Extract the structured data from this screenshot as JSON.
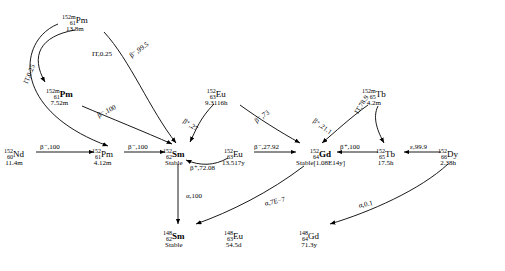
{
  "diagram": {
    "type": "nuclear-decay-chain",
    "title": "",
    "nodes": [
      {
        "id": "pm152m2",
        "mass": "152m",
        "z": "61",
        "sym": "Pm",
        "bold": false,
        "line2": "13.8m",
        "x": 76,
        "y": 14
      },
      {
        "id": "pm152m",
        "mass": "152m",
        "z": "61",
        "sym": "Pm",
        "bold": true,
        "line2": "7.52m",
        "x": 60,
        "y": 88
      },
      {
        "id": "eu152",
        "mass": "152",
        "z": "63",
        "sym": "Eu",
        "bold": false,
        "line2": "9.3116h",
        "x": 215,
        "y": 88
      },
      {
        "id": "tb152m",
        "mass": "152m",
        "z": "65",
        "sym": "Tb",
        "bold": false,
        "line2": "4.2m",
        "x": 372,
        "y": 88
      },
      {
        "id": "nd152",
        "mass": "152",
        "z": "60",
        "sym": "Nd",
        "bold": false,
        "line2": "11.4m",
        "x": 10,
        "y": 148
      },
      {
        "id": "pm152",
        "mass": "152",
        "z": "61",
        "sym": "Pm",
        "bold": false,
        "line2": "4.12m",
        "x": 98,
        "y": 148
      },
      {
        "id": "sm152",
        "mass": "152",
        "z": "62",
        "sym": "Sm",
        "bold": true,
        "line2": "Stable",
        "x": 168,
        "y": 148
      },
      {
        "id": "eu152b",
        "mass": "152",
        "z": "63",
        "sym": "Eu",
        "bold": false,
        "line2": "13.517y",
        "x": 228,
        "y": 148
      },
      {
        "id": "gd152",
        "mass": "152",
        "z": "64",
        "sym": "Gd",
        "bold": true,
        "line2": "Stable[1.08E14y]",
        "x": 300,
        "y": 148
      },
      {
        "id": "tb152",
        "mass": "152",
        "z": "65",
        "sym": "Tb",
        "bold": false,
        "line2": "17.5h",
        "x": 380,
        "y": 148
      },
      {
        "id": "dy152",
        "mass": "152",
        "z": "66",
        "sym": "Dy",
        "bold": false,
        "line2": "2.38h",
        "x": 443,
        "y": 148
      },
      {
        "id": "sm148",
        "mass": "148",
        "z": "62",
        "sym": "Sm",
        "bold": true,
        "line2": "Stable",
        "x": 168,
        "y": 228
      },
      {
        "id": "eu148",
        "mass": "148",
        "z": "63",
        "sym": "Eu",
        "bold": false,
        "line2": "54.5d",
        "x": 230,
        "y": 228
      },
      {
        "id": "gd148",
        "mass": "148",
        "z": "64",
        "sym": "Gd",
        "bold": false,
        "line2": "71.3y",
        "x": 305,
        "y": 228
      }
    ],
    "edges": [
      {
        "id": "e1",
        "label": "IT,0.25",
        "x": 22,
        "y": 82,
        "rot": -68
      },
      {
        "id": "e2",
        "label": "IT,0.25",
        "x": 92,
        "y": 50,
        "rot": 0
      },
      {
        "id": "e3",
        "label": "β⁻,99.5",
        "x": 128,
        "y": 53,
        "rot": -36
      },
      {
        "id": "e4",
        "label": "β⁻,100",
        "x": 96,
        "y": 112,
        "rot": -26
      },
      {
        "id": "e5",
        "label": "β⁺,27",
        "x": 186,
        "y": 117,
        "rot": 35
      },
      {
        "id": "e6",
        "label": "β⁻,73",
        "x": 253,
        "y": 118,
        "rot": -35
      },
      {
        "id": "e7",
        "label": "IT,78.9",
        "x": 353,
        "y": 111,
        "rot": -58
      },
      {
        "id": "e8",
        "label": "β⁺,21.1",
        "x": 316,
        "y": 117,
        "rot": 36
      },
      {
        "id": "e9",
        "label": "β⁻,100",
        "x": 24,
        "y": 145,
        "rot": 0
      },
      {
        "id": "e10",
        "label": "β⁻,100",
        "x": 122,
        "y": 145,
        "rot": 0
      },
      {
        "id": "e11",
        "label": "β⁻,27.92",
        "x": 252,
        "y": 145,
        "rot": 0
      },
      {
        "id": "e12",
        "label": "β⁺,100",
        "x": 340,
        "y": 145,
        "rot": 0
      },
      {
        "id": "e13",
        "label": "ε,99.9",
        "x": 412,
        "y": 145,
        "rot": 0
      },
      {
        "id": "e14",
        "label": "β⁺,72.08",
        "x": 192,
        "y": 165,
        "rot": 0
      },
      {
        "id": "e15",
        "label": "α,100",
        "x": 190,
        "y": 196,
        "rot": 0
      },
      {
        "id": "e16",
        "label": "α,7E−7",
        "x": 268,
        "y": 203,
        "rot": -13
      },
      {
        "id": "e17",
        "label": "α,0.1",
        "x": 362,
        "y": 205,
        "rot": -12
      }
    ]
  }
}
